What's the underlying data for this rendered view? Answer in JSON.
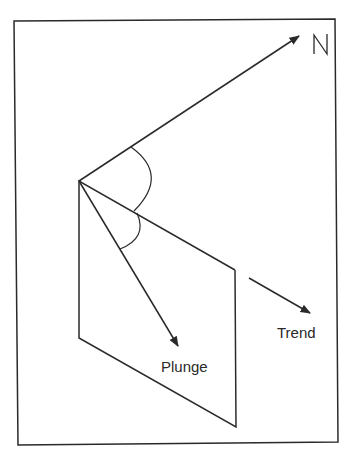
{
  "diagram": {
    "type": "geology-plunge-trend",
    "labels": {
      "north": "N",
      "plunge": "Plunge",
      "trend": "Trend"
    },
    "colors": {
      "line": "#2a2a2a",
      "background": "#ffffff"
    }
  }
}
